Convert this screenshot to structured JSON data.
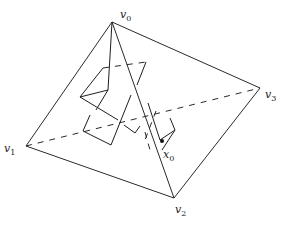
{
  "diagram": {
    "type": "tetrahedron-with-random-walk-path",
    "vertices": [
      {
        "id": "v0",
        "label": "v",
        "sub": "0",
        "x": 112,
        "y": 22,
        "lx": 120,
        "ly": 18
      },
      {
        "id": "v1",
        "label": "v",
        "sub": "1",
        "x": 26,
        "y": 146,
        "lx": 4,
        "ly": 152
      },
      {
        "id": "v2",
        "label": "v",
        "sub": "2",
        "x": 174,
        "y": 198,
        "lx": 175,
        "ly": 213
      },
      {
        "id": "v3",
        "label": "v",
        "sub": "3",
        "x": 260,
        "y": 88,
        "lx": 265,
        "ly": 98
      }
    ],
    "point": {
      "id": "x0",
      "label": "x",
      "sub": "0",
      "x": 162,
      "y": 141,
      "lx": 163,
      "ly": 158
    },
    "visible_edges": [
      [
        "v0",
        "v1"
      ],
      [
        "v0",
        "v2"
      ],
      [
        "v0",
        "v3"
      ],
      [
        "v1",
        "v2"
      ],
      [
        "v2",
        "v3"
      ]
    ],
    "hidden_edges": [
      [
        "v1",
        "v3"
      ]
    ],
    "colors": {
      "line": "#2a2a2a",
      "background": "#ffffff"
    }
  }
}
